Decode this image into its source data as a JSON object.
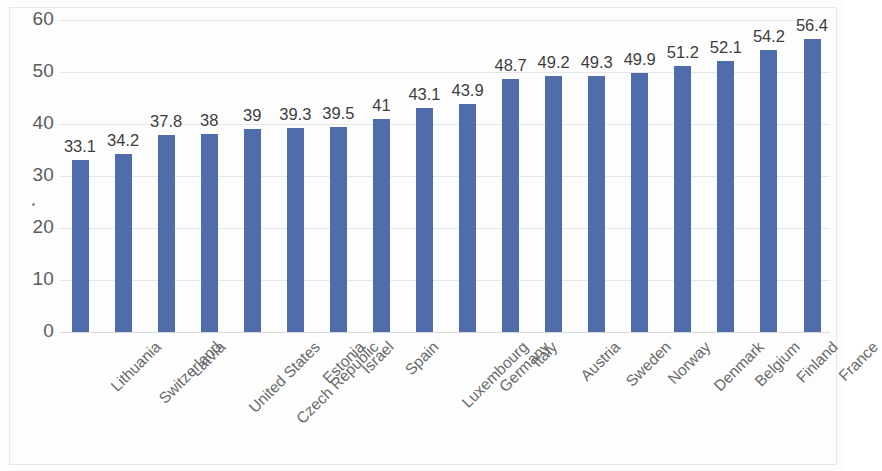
{
  "chart_data": {
    "type": "bar",
    "title": "",
    "subtitle": "",
    "xlabel": "",
    "ylabel": "",
    "ylim": [
      0,
      60
    ],
    "ytick_labels": [
      "60",
      "50",
      "40",
      "30",
      "20",
      "10",
      "0"
    ],
    "yticks": [
      60,
      50,
      40,
      30,
      20,
      10,
      0
    ],
    "grid": true,
    "legend": "none",
    "bar_color": "#4f6cab",
    "label_color": "#3d3d3d",
    "axis_color": "#5c5c5c",
    "categories": [
      "Lithuania",
      "Switzerland",
      "Latvia",
      "United States",
      "Czech Republic",
      "Estonia",
      "Israel",
      "Spain",
      "Luxembourg",
      "Germany",
      "Italy",
      "Austria",
      "Sweden",
      "Norway",
      "Denmark",
      "Belgium",
      "Finland",
      "France"
    ],
    "values": [
      33.1,
      34.2,
      37.8,
      38,
      39,
      39.3,
      39.5,
      41,
      43.1,
      43.9,
      48.7,
      49.2,
      49.3,
      49.9,
      51.2,
      52.1,
      54.2,
      56.4
    ],
    "value_labels": [
      "33.1",
      "34.2",
      "37.8",
      "38",
      "39",
      "39.3",
      "39.5",
      "41",
      "43.1",
      "43.9",
      "48.7",
      "49.2",
      "49.3",
      "49.9",
      "51.2",
      "52.1",
      "54.2",
      "56.4"
    ]
  }
}
